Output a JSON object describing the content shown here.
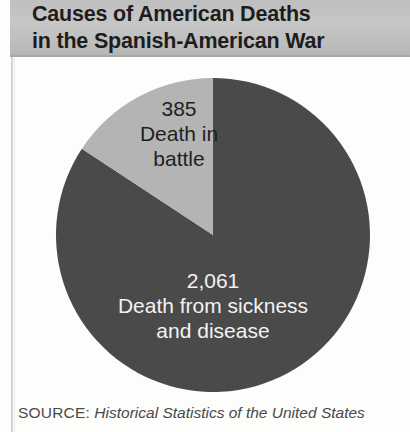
{
  "figure": {
    "title_line1": "Causes of American Deaths",
    "title_line2": "in the Spanish-American War",
    "title_full": "Causes of American Deaths\nin the Spanish-American War",
    "background_color": "#fdfdfc",
    "title_band_color": "#c0c0c0",
    "title_text_color": "#1d1d1d"
  },
  "source": {
    "label": "SOURCE:",
    "citation": "Historical Statistics of the United States",
    "text_color": "#4a4a4a"
  },
  "labels": {
    "battle": {
      "value_text": "385",
      "caption": "Death in\nbattle",
      "full": "385\nDeath in\nbattle",
      "text_color": "#1f1f1f"
    },
    "sickness": {
      "value_text": "2,061",
      "caption": "Death from sickness\nand disease",
      "full": "2,061\nDeath from sickness\nand disease",
      "text_color": "#f2f2f2"
    }
  },
  "chart_data": {
    "type": "pie",
    "title": "Causes of American Deaths in the Spanish-American War",
    "subtitle": "",
    "xlabel": "",
    "ylabel": "",
    "grid": false,
    "legend": "none (labels drawn inside slices)",
    "start_angle_deg": 90,
    "direction": "counterclockwise",
    "total": 2446,
    "categories": [
      "Death in battle",
      "Death from sickness and disease"
    ],
    "values": [
      385,
      2061
    ],
    "percentages": [
      15.7,
      84.3
    ],
    "colors": [
      "#b4b4b4",
      "#4a4a4a"
    ],
    "slices": [
      {
        "label": "Death in battle",
        "value": 385,
        "value_text": "385",
        "percent": 15.7,
        "color": "#b4b4b4",
        "label_color": "#1f1f1f"
      },
      {
        "label": "Death from sickness and disease",
        "value": 2061,
        "value_text": "2,061",
        "percent": 84.3,
        "color": "#4a4a4a",
        "label_color": "#f2f2f2"
      }
    ],
    "annotations": [
      "SOURCE: Historical Statistics of the United States"
    ]
  }
}
